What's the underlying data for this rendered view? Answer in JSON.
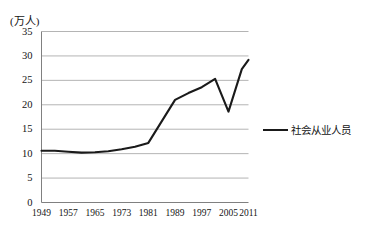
{
  "chart_data": {
    "type": "line",
    "title": "",
    "subtitle": "",
    "xlabel": "",
    "ylabel": "(万人)",
    "unit_label": "(万人)",
    "xlim": [
      1949,
      2011
    ],
    "ylim": [
      0,
      35
    ],
    "ytick_labels": [
      "35",
      "30",
      "25",
      "20",
      "15",
      "10",
      "5",
      "0"
    ],
    "ytick_values": [
      35,
      30,
      25,
      20,
      15,
      10,
      5,
      0
    ],
    "xtick_labels": [
      "1949",
      "1957",
      "1965",
      "1973",
      "1981",
      "1989",
      "1997",
      "2005",
      "2011"
    ],
    "xtick_values": [
      1949,
      1957,
      1965,
      1973,
      1981,
      1989,
      1997,
      2005,
      2011
    ],
    "grid": true,
    "grid_axis": "y",
    "legend_position": "right",
    "line_color": "#1a1a1a",
    "grid_color": "#b4b4b4",
    "axis_color": "#808080",
    "series": [
      {
        "name": "社会从业人员",
        "x": [
          1949,
          1953,
          1957,
          1961,
          1965,
          1969,
          1973,
          1977,
          1981,
          1985,
          1989,
          1993,
          1997,
          2001,
          2005,
          2009,
          2011
        ],
        "values": [
          10.6,
          10.6,
          10.4,
          10.2,
          10.3,
          10.5,
          10.9,
          11.4,
          12.2,
          16.6,
          21.0,
          22.4,
          23.6,
          25.3,
          18.6,
          27.3,
          29.2
        ]
      }
    ]
  },
  "legend": {
    "entries": [
      {
        "label": "社会从业人员"
      }
    ]
  }
}
